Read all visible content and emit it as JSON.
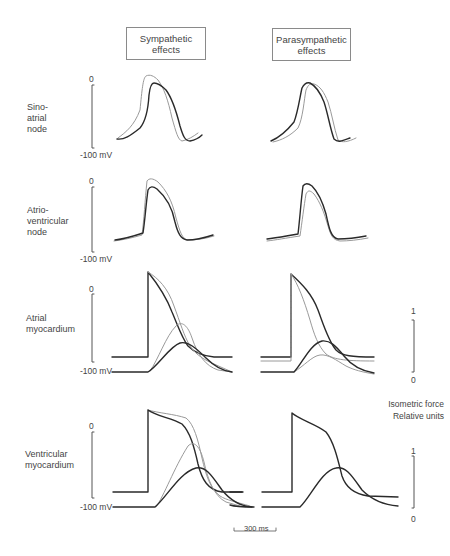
{
  "headers": {
    "sympathetic": "Sympathetic\neffects",
    "parasympathetic": "Parasympathetic\neffects"
  },
  "rows": [
    {
      "label": "Sino-\natrial\nnode",
      "top_tick": "0",
      "bottom_tick": "-100 mV"
    },
    {
      "label": "Atrio-\nventricular\nnode",
      "top_tick": "0",
      "bottom_tick": "-100 mV"
    },
    {
      "label": "Atrial\nmyocardium",
      "top_tick": "0",
      "bottom_tick": "-100 mV"
    },
    {
      "label": "Ventricular\nmyocardium",
      "top_tick": "0",
      "bottom_tick": "-100 mV"
    }
  ],
  "force_axis": {
    "label": "Isometric force\nRelative units",
    "atrial": {
      "top": "1",
      "bottom": "0"
    },
    "ventricular": {
      "top": "1",
      "bottom": "0"
    }
  },
  "scale_bar": {
    "label": "300 ms"
  },
  "legend_semantics": {
    "dark_trace": "control",
    "light_trace": "with autonomic effect"
  },
  "colors": {
    "control": "#2a2a2a",
    "modified": "#9a9a9a",
    "axis": "#555555"
  }
}
